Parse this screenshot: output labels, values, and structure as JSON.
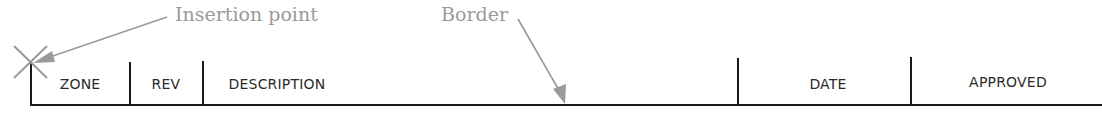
{
  "annotations": {
    "insertion_point": "Insertion point",
    "border": "Border"
  },
  "revision_block": {
    "columns": [
      {
        "label": "ZONE"
      },
      {
        "label": "REV"
      },
      {
        "label": "DESCRIPTION"
      },
      {
        "label": "DATE"
      },
      {
        "label": "APPROVED"
      }
    ]
  },
  "colors": {
    "line": "#1a1a1a",
    "annotation": "#9a9a9a"
  }
}
